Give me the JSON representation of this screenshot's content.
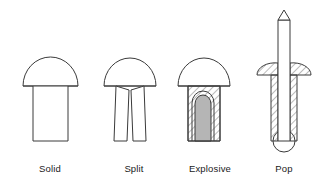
{
  "figure": {
    "type": "line-drawing",
    "background_color": "#ffffff",
    "line_color": "#3a3a3a",
    "hatch_color": "#555555",
    "charge_fill_color": "#b5b5b5"
  },
  "items": [
    {
      "id": "solid",
      "label": "Solid",
      "icon": "solid-rivet-icon",
      "description": "dome head with plain cylindrical shank"
    },
    {
      "id": "split",
      "label": "Split",
      "icon": "split-rivet-icon",
      "description": "dome head with shank split into two legs"
    },
    {
      "id": "explosive",
      "label": "Explosive",
      "icon": "explosive-rivet-icon",
      "description": "dome head with sectioned shank containing explosive charge cavity"
    },
    {
      "id": "pop",
      "label": "Pop",
      "icon": "pop-rivet-icon",
      "description": "flanged body with long mandrel and bulbed tail"
    }
  ]
}
